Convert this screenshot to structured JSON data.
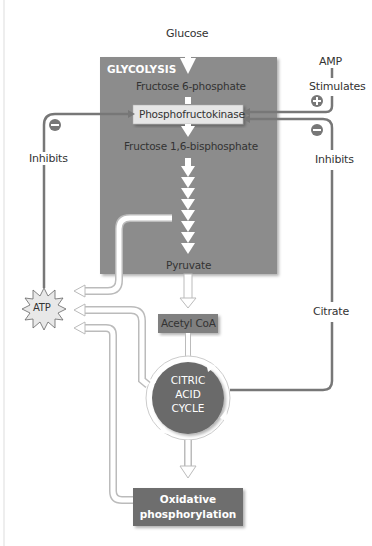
{
  "diagram": {
    "title_block": "GLYCOLYSIS",
    "nodes": {
      "glucose": "Glucose",
      "f6p": "Fructose 6-phosphate",
      "pfk": "Phosphofructokinase",
      "f16bp": "Fructose 1,6-bisphosphate",
      "pyruvate": "Pyruvate",
      "acetyl_coa": "Acetyl CoA",
      "cycle_line1": "CITRIC",
      "cycle_line2": "ACID",
      "cycle_line3": "CYCLE",
      "oxphos_line1": "Oxidative",
      "oxphos_line2": "phosphorylation",
      "atp": "ATP",
      "amp": "AMP",
      "citrate": "Citrate"
    },
    "regulation": {
      "amp_effect": "Stimulates",
      "atp_effect": "Inhibits",
      "citrate_effect": "Inhibits",
      "plus_sign": "+",
      "minus_sign": "−"
    },
    "colors": {
      "glycolysis_box": "#8c8c8c",
      "pfk_box": "#e6e6e6",
      "acetyl_box": "#808080",
      "cycle_circle": "#6a6a6a",
      "oxphos_box": "#6e6e6e",
      "reg_line": "#777777"
    }
  }
}
